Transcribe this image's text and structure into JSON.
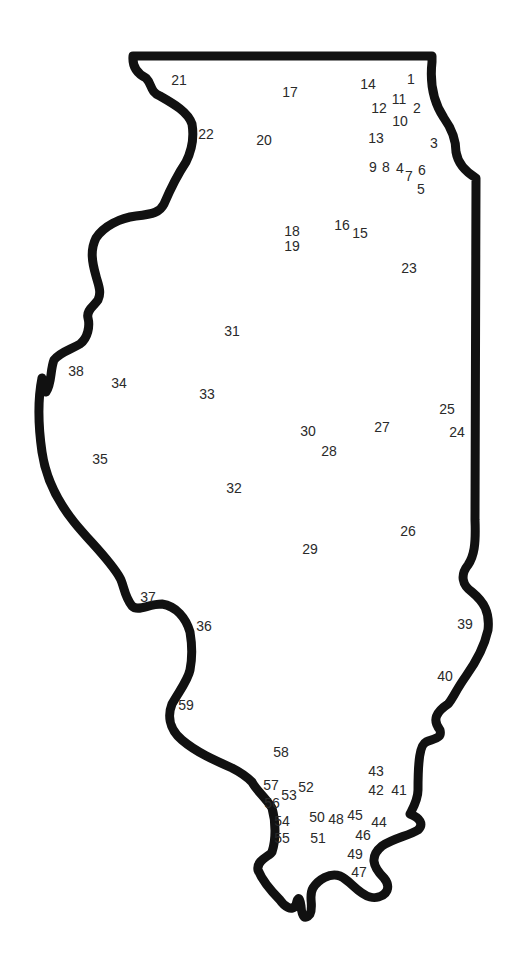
{
  "map": {
    "title": "Illinois connect-the-dots outline",
    "region": "Illinois",
    "colors": {
      "background": "#ffffff",
      "outline": "#111111",
      "label": "#2a2a2a"
    },
    "dots": [
      {
        "n": "1"
      },
      {
        "n": "2"
      },
      {
        "n": "3"
      },
      {
        "n": "4"
      },
      {
        "n": "5"
      },
      {
        "n": "6"
      },
      {
        "n": "7"
      },
      {
        "n": "8"
      },
      {
        "n": "9"
      },
      {
        "n": "10"
      },
      {
        "n": "11"
      },
      {
        "n": "12"
      },
      {
        "n": "13"
      },
      {
        "n": "14"
      },
      {
        "n": "15"
      },
      {
        "n": "16"
      },
      {
        "n": "17"
      },
      {
        "n": "18"
      },
      {
        "n": "19"
      },
      {
        "n": "20"
      },
      {
        "n": "21"
      },
      {
        "n": "22"
      },
      {
        "n": "23"
      },
      {
        "n": "24"
      },
      {
        "n": "25"
      },
      {
        "n": "26"
      },
      {
        "n": "27"
      },
      {
        "n": "28"
      },
      {
        "n": "29"
      },
      {
        "n": "30"
      },
      {
        "n": "31"
      },
      {
        "n": "32"
      },
      {
        "n": "33"
      },
      {
        "n": "34"
      },
      {
        "n": "35"
      },
      {
        "n": "36"
      },
      {
        "n": "37"
      },
      {
        "n": "38"
      },
      {
        "n": "39"
      },
      {
        "n": "40"
      },
      {
        "n": "41"
      },
      {
        "n": "42"
      },
      {
        "n": "43"
      },
      {
        "n": "44"
      },
      {
        "n": "45"
      },
      {
        "n": "46"
      },
      {
        "n": "47"
      },
      {
        "n": "48"
      },
      {
        "n": "49"
      },
      {
        "n": "50"
      },
      {
        "n": "51"
      },
      {
        "n": "52"
      },
      {
        "n": "53"
      },
      {
        "n": "54"
      },
      {
        "n": "55"
      },
      {
        "n": "56"
      },
      {
        "n": "57"
      },
      {
        "n": "58"
      },
      {
        "n": "59"
      }
    ]
  }
}
